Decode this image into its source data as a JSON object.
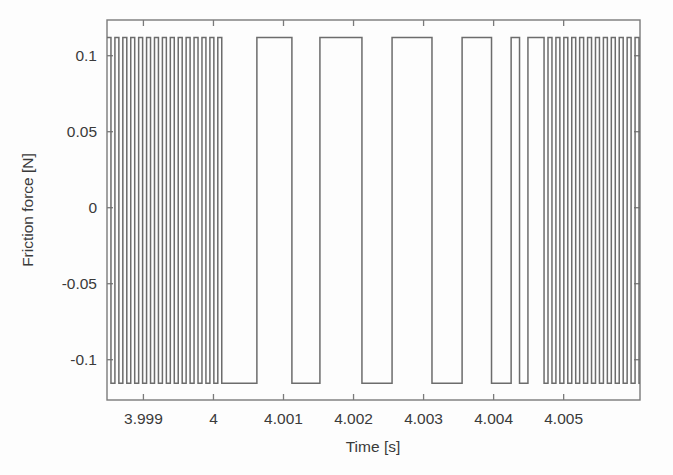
{
  "chart_data": {
    "type": "line",
    "title": "",
    "subtitle": "",
    "xlabel": "Time [s]",
    "ylabel": "Friction force [N]",
    "xlim": [
      3.99848,
      4.00609
    ],
    "ylim": [
      -0.1265,
      0.1235
    ],
    "xticks": [
      3.999,
      4,
      4.001,
      4.002,
      4.003,
      4.004,
      4.005
    ],
    "xticklabels": [
      "3.999",
      "4",
      "4.001",
      "4.002",
      "4.003",
      "4.004",
      "4.005"
    ],
    "yticks": [
      0.1,
      0.05,
      0,
      -0.05,
      -0.1
    ],
    "yticklabels": [
      "0.1",
      "0.05",
      "0",
      "-0.05",
      "-0.1"
    ],
    "grid": false,
    "legend": null,
    "series": [
      {
        "name": "Friction force",
        "color": "#6c6c6c",
        "waveform": "square",
        "high_level": 0.112,
        "low_level": -0.1155,
        "description": "Square-wave friction force alternating between stick-slip limits; fast chattering at both ends of the window and slow limit-cycle switching in the middle.",
        "segments": [
          {
            "from": 3.99848,
            "to": 4.00012,
            "mode": "fast",
            "half_period": 5.65e-05,
            "start_state": "high"
          },
          {
            "from": 4.00012,
            "to": 4.00062,
            "mode": "hold",
            "state": "low"
          },
          {
            "from": 4.00062,
            "to": 4.00112,
            "mode": "hold",
            "state": "high"
          },
          {
            "from": 4.00112,
            "to": 4.00152,
            "mode": "hold",
            "state": "low"
          },
          {
            "from": 4.00152,
            "to": 4.00212,
            "mode": "hold",
            "state": "high"
          },
          {
            "from": 4.00212,
            "to": 4.00255,
            "mode": "hold",
            "state": "low"
          },
          {
            "from": 4.00255,
            "to": 4.00312,
            "mode": "hold",
            "state": "high"
          },
          {
            "from": 4.00312,
            "to": 4.00355,
            "mode": "hold",
            "state": "low"
          },
          {
            "from": 4.00355,
            "to": 4.00397,
            "mode": "hold",
            "state": "high"
          },
          {
            "from": 4.00397,
            "to": 4.00425,
            "mode": "hold",
            "state": "low"
          },
          {
            "from": 4.00425,
            "to": 4.00437,
            "mode": "hold",
            "state": "high"
          },
          {
            "from": 4.00437,
            "to": 4.00449,
            "mode": "hold",
            "state": "low"
          },
          {
            "from": 4.00449,
            "to": 4.00472,
            "mode": "hold",
            "state": "high"
          },
          {
            "from": 4.00472,
            "to": 4.00609,
            "mode": "fast",
            "half_period": 5.65e-05,
            "start_state": "low"
          }
        ]
      }
    ]
  },
  "axes": {
    "box": {
      "left": 107,
      "top": 20,
      "right": 640,
      "bottom": 400
    },
    "line_color": "#7a7a7a",
    "tick_length": 6
  },
  "labels": {
    "y_axis_title": "Friction force [N]",
    "x_axis_title": "Time [s]"
  }
}
